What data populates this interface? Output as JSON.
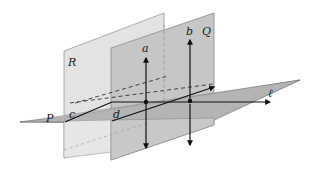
{
  "figure": {
    "type": "geometry-planes",
    "colors": {
      "background": "#ffffff",
      "plane_r": "#e3e3e3",
      "plane_q": "#c4c4c4",
      "plane_p": "#b5b5b5",
      "edge": "#8a8a8a",
      "line": "#111111"
    },
    "labels": {
      "plane_r": "R",
      "plane_q": "Q",
      "plane_p": "P",
      "line_a": "a",
      "line_b": "b",
      "line_c": "c",
      "line_d": "d",
      "line_l": "ℓ"
    }
  }
}
